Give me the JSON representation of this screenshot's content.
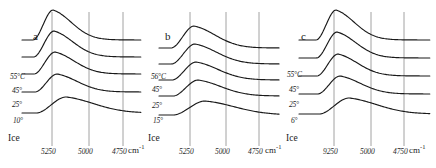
{
  "figure": {
    "width": 436,
    "height": 168,
    "background": "#ffffff",
    "curve_color": "#1a1a1a",
    "gridline_color": "#8c8c8c",
    "text_color": "#1c1c1c"
  },
  "panels": [
    {
      "letter": "a",
      "letter_x": 33,
      "letter_y": 30,
      "origin_x": 8,
      "width": 140,
      "gridlines": [
        {
          "label": "5250",
          "x": 52
        },
        {
          "label": "5000",
          "x": 89
        },
        {
          "label": "4750",
          "x": 123
        }
      ],
      "unit": "cm",
      "unit_sup": "-1",
      "unit_x": 128,
      "traces": [
        {
          "label": "55°C",
          "label_x": 10,
          "label_y": 72,
          "baseline": 40,
          "peak_height": 30,
          "peak_x": 53,
          "width_factor": 1.0
        },
        {
          "label": "45°",
          "label_x": 12,
          "label_y": 86,
          "baseline": 57,
          "peak_height": 26,
          "peak_x": 54,
          "width_factor": 1.02
        },
        {
          "label": "25°",
          "label_x": 12,
          "label_y": 100,
          "baseline": 74,
          "peak_height": 22,
          "peak_x": 55,
          "width_factor": 1.05
        },
        {
          "label": "10°",
          "label_x": 13,
          "label_y": 116,
          "baseline": 92,
          "peak_height": 18,
          "peak_x": 57,
          "width_factor": 1.1
        },
        {
          "label": "Ice",
          "label_x": 8,
          "label_y": 133,
          "baseline": 113,
          "peak_height": 16,
          "peak_x": 66,
          "width_factor": 1.5,
          "is_ice": true
        }
      ]
    },
    {
      "letter": "b",
      "letter_x": 165,
      "letter_y": 30,
      "origin_x": 145,
      "width": 140,
      "gridlines": [
        {
          "label": "5250",
          "x": 190
        },
        {
          "label": "5000",
          "x": 226
        },
        {
          "label": "4750",
          "x": 259
        }
      ],
      "unit": "cm",
      "unit_sup": "-1",
      "unit_x": 265,
      "traces": [
        {
          "label": "56°C",
          "label_x": 151,
          "label_y": 72,
          "baseline": 48,
          "peak_height": 22,
          "peak_x": 194,
          "width_factor": 1.15
        },
        {
          "label": "45°",
          "label_x": 152,
          "label_y": 85,
          "baseline": 64,
          "peak_height": 20,
          "peak_x": 195,
          "width_factor": 1.18
        },
        {
          "label": "25°",
          "label_x": 152,
          "label_y": 101,
          "baseline": 80,
          "peak_height": 18,
          "peak_x": 196,
          "width_factor": 1.2
        },
        {
          "label": "15°",
          "label_x": 153,
          "label_y": 116,
          "baseline": 96,
          "peak_height": 16,
          "peak_x": 198,
          "width_factor": 1.25
        },
        {
          "label": "Ice",
          "label_x": 148,
          "label_y": 133,
          "baseline": 115,
          "peak_height": 14,
          "peak_x": 205,
          "width_factor": 1.6,
          "is_ice": true
        }
      ]
    },
    {
      "letter": "c",
      "letter_x": 301,
      "letter_y": 30,
      "origin_x": 285,
      "width": 151,
      "gridlines": [
        {
          "label": "9250",
          "x": 334
        },
        {
          "label": "5000",
          "x": 371
        },
        {
          "label": "4750",
          "x": 404
        }
      ],
      "unit": "cm",
      "unit_sup": "-1",
      "unit_x": 409,
      "traces": [
        {
          "label": "55°C",
          "label_x": 287,
          "label_y": 70,
          "baseline": 40,
          "peak_height": 30,
          "peak_x": 336,
          "width_factor": 1.0
        },
        {
          "label": "45°",
          "label_x": 289,
          "label_y": 85,
          "baseline": 58,
          "peak_height": 26,
          "peak_x": 337,
          "width_factor": 1.03
        },
        {
          "label": "25°",
          "label_x": 289,
          "label_y": 100,
          "baseline": 76,
          "peak_height": 22,
          "peak_x": 338,
          "width_factor": 1.06
        },
        {
          "label": "6°",
          "label_x": 291,
          "label_y": 116,
          "baseline": 94,
          "peak_height": 18,
          "peak_x": 340,
          "width_factor": 1.12
        },
        {
          "label": "Ice",
          "label_x": 286,
          "label_y": 133,
          "baseline": 114,
          "peak_height": 16,
          "peak_x": 349,
          "width_factor": 1.5,
          "is_ice": true
        }
      ]
    }
  ],
  "chart_data": {
    "type": "line",
    "title": "",
    "xlabel": "cm-1",
    "ylabel": "",
    "panels": [
      {
        "name": "a",
        "xticks": [
          5250,
          5000,
          4750
        ],
        "xunit": "cm-1",
        "series": [
          {
            "name": "55°C",
            "peak_cm": 5250
          },
          {
            "name": "45°",
            "peak_cm": 5245
          },
          {
            "name": "25°",
            "peak_cm": 5240
          },
          {
            "name": "10°",
            "peak_cm": 5225
          },
          {
            "name": "Ice",
            "peak_cm": 5160
          }
        ]
      },
      {
        "name": "b",
        "xticks": [
          5250,
          5000,
          4750
        ],
        "xunit": "cm-1",
        "series": [
          {
            "name": "56°C",
            "peak_cm": 5225
          },
          {
            "name": "45°",
            "peak_cm": 5220
          },
          {
            "name": "25°",
            "peak_cm": 5215
          },
          {
            "name": "15°",
            "peak_cm": 5200
          },
          {
            "name": "Ice",
            "peak_cm": 5150
          }
        ]
      },
      {
        "name": "c",
        "xticks": [
          9250,
          5000,
          4750
        ],
        "xunit": "cm-1",
        "series": [
          {
            "name": "55°C",
            "peak_cm": 9250
          },
          {
            "name": "45°",
            "peak_cm": 9240
          },
          {
            "name": "25°",
            "peak_cm": 9230
          },
          {
            "name": "6°",
            "peak_cm": 9215
          },
          {
            "name": "Ice",
            "peak_cm": 9140
          }
        ]
      }
    ]
  }
}
